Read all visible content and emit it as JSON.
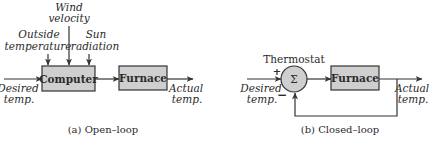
{
  "open_loop": {
    "caption": "(a) Open–loop",
    "blocks": {
      "computer": "Computer",
      "furnace": "Furnace"
    },
    "disturbances": {
      "outside_temperature": [
        "Outside",
        "temperature"
      ],
      "wind_velocity": [
        "Wind",
        "velocity"
      ],
      "sun_radiation": [
        "Sun",
        "radiation"
      ]
    },
    "input": [
      "Desired",
      "temp."
    ],
    "output": [
      "Actual",
      "temp."
    ]
  },
  "closed_loop": {
    "caption": "(b) Closed–loop",
    "summer": {
      "label": "Thermostat",
      "symbol": "Σ",
      "plus": "+",
      "minus": "−"
    },
    "blocks": {
      "furnace": "Furnace"
    },
    "input": [
      "Desired",
      "temp."
    ],
    "output": [
      "Actual",
      "temp."
    ]
  },
  "colors": {
    "block_fill": "#cfcfcf",
    "stroke": "#333333",
    "text": "#2a2a2a"
  }
}
